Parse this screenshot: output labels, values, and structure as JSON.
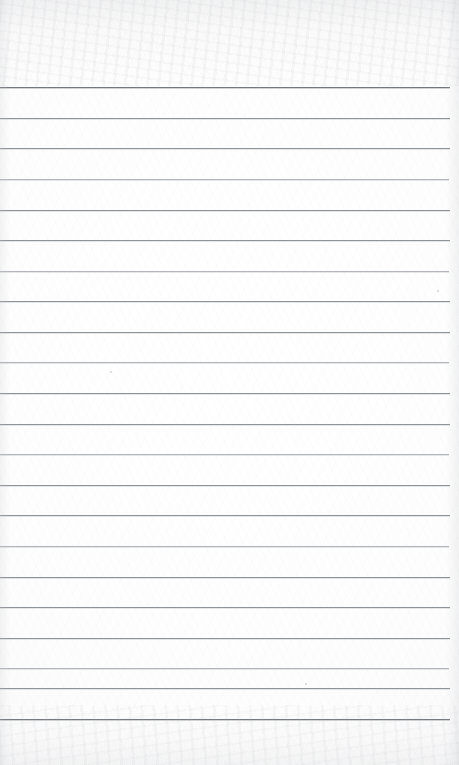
{
  "document": {
    "kind": "scanned-lined-notebook-page",
    "title": "Blank ruled notebook page",
    "written_text": "",
    "page_width": 459,
    "page_height": 765
  },
  "paper": {
    "background_color": "#fdfdfd",
    "edge_shadow_color": "#bec0c4",
    "noise_top_height": 86,
    "noise_bottom_height": 60
  },
  "ruling": {
    "line_color": "#9ea2a8",
    "heavy_line_color": "#73777e",
    "light_line_color": "#b2b6bc",
    "line_count": 21,
    "line_spacing": 30.6,
    "first_line_y": 87,
    "last_line_y": 719,
    "left_x": 0,
    "right_x": 450,
    "lines": [
      {
        "y": 87,
        "weight": "heavy",
        "x_end": 450
      },
      {
        "y": 118,
        "weight": "medium",
        "x_end": 450
      },
      {
        "y": 148,
        "weight": "medium",
        "x_end": 450
      },
      {
        "y": 179,
        "weight": "light",
        "x_end": 449
      },
      {
        "y": 210,
        "weight": "medium",
        "x_end": 450
      },
      {
        "y": 240,
        "weight": "medium",
        "x_end": 450
      },
      {
        "y": 271,
        "weight": "light",
        "x_end": 449
      },
      {
        "y": 301,
        "weight": "medium",
        "x_end": 450
      },
      {
        "y": 332,
        "weight": "medium",
        "x_end": 450
      },
      {
        "y": 362,
        "weight": "light",
        "x_end": 449
      },
      {
        "y": 393,
        "weight": "medium",
        "x_end": 450
      },
      {
        "y": 424,
        "weight": "medium",
        "x_end": 450
      },
      {
        "y": 454,
        "weight": "light",
        "x_end": 449
      },
      {
        "y": 485,
        "weight": "medium",
        "x_end": 450
      },
      {
        "y": 515,
        "weight": "medium",
        "x_end": 450
      },
      {
        "y": 546,
        "weight": "light",
        "x_end": 449
      },
      {
        "y": 577,
        "weight": "medium",
        "x_end": 450
      },
      {
        "y": 607,
        "weight": "medium",
        "x_end": 450
      },
      {
        "y": 638,
        "weight": "medium",
        "x_end": 450
      },
      {
        "y": 688,
        "weight": "medium",
        "x_end": 450
      },
      {
        "y": 719,
        "weight": "heavy",
        "x_end": 450
      }
    ],
    "extra_lines": [
      {
        "y": 668,
        "weight": "light",
        "x_end": 449
      }
    ]
  },
  "artifacts": {
    "specks": [
      {
        "x": 110,
        "y": 371,
        "size": "tiny"
      },
      {
        "x": 305,
        "y": 683,
        "size": "tiny"
      },
      {
        "x": 437,
        "y": 290,
        "size": "tiny"
      }
    ]
  }
}
